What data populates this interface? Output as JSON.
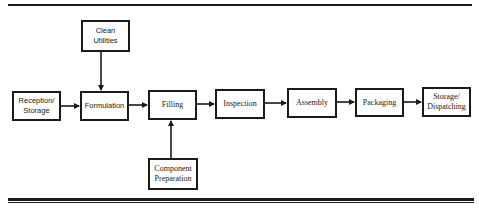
{
  "diagram": {
    "type": "process-flowchart",
    "nodes": [
      {
        "id": "clean-utilities",
        "label": "Clean\nUtilities"
      },
      {
        "id": "reception-storage",
        "label": "Reception/\nStorage"
      },
      {
        "id": "formulation",
        "label": "Formulation"
      },
      {
        "id": "filling",
        "label": "Filling"
      },
      {
        "id": "inspection",
        "label": "Inspection"
      },
      {
        "id": "assembly",
        "label": "Assembly"
      },
      {
        "id": "packaging",
        "label": "Packaging"
      },
      {
        "id": "storage-dispatching",
        "label": "Storage/\nDispatching"
      },
      {
        "id": "component-preparation",
        "label": "Component\nPreparation"
      }
    ],
    "edges": [
      {
        "from": "clean-utilities",
        "to": "formulation"
      },
      {
        "from": "reception-storage",
        "to": "formulation"
      },
      {
        "from": "formulation",
        "to": "filling"
      },
      {
        "from": "component-preparation",
        "to": "filling"
      },
      {
        "from": "filling",
        "to": "inspection"
      },
      {
        "from": "inspection",
        "to": "assembly"
      },
      {
        "from": "assembly",
        "to": "packaging"
      },
      {
        "from": "packaging",
        "to": "storage-dispatching"
      }
    ]
  },
  "labels": {
    "clean_utilities": "Clean Utilities",
    "reception_storage": "Reception/ Storage",
    "formulation": "Formulation",
    "filling": "Filling",
    "inspection": "Inspection",
    "assembly": "Assembly",
    "packaging": "Packaging",
    "storage_dispatching": "Storage/ Dispatching",
    "component_preparation": "Component Preparation"
  }
}
